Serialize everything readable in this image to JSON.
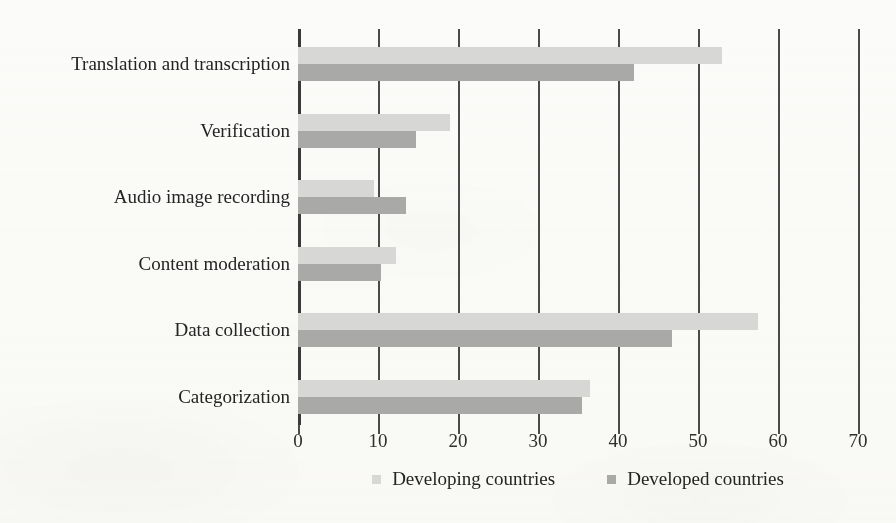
{
  "chart_data": {
    "type": "bar",
    "orientation": "horizontal",
    "title": "",
    "subtitle": "",
    "xlabel": "",
    "ylabel": "",
    "xlim": [
      0,
      70
    ],
    "xticks": [
      0,
      10,
      20,
      30,
      40,
      50,
      60,
      70
    ],
    "xtick_labels": [
      "0",
      "10",
      "20",
      "30",
      "40",
      "50",
      "60",
      "70"
    ],
    "grid": "vertical",
    "legend_position": "bottom",
    "categories": [
      "Translation and transcription",
      "Verification",
      "Audio image recording",
      "Content moderation",
      "Data collection",
      "Categorization"
    ],
    "series": [
      {
        "name": "Developing countries",
        "color": "#d7d7d5",
        "values": [
          53,
          19,
          9.5,
          12.3,
          57.5,
          36.5
        ]
      },
      {
        "name": "Developed countries",
        "color": "#a9a9a7",
        "values": [
          42,
          14.7,
          13.5,
          10.4,
          46.7,
          35.5
        ]
      }
    ]
  },
  "legend": {
    "entries": [
      {
        "label": "Developing countries",
        "swatch": "developing"
      },
      {
        "label": "Developed countries",
        "swatch": "developed"
      }
    ]
  },
  "colors": {
    "developing": "#d7d7d5",
    "developed": "#a9a9a7",
    "axis": "#4a4a4a",
    "background": "#fbfbf9",
    "text": "#242424"
  }
}
